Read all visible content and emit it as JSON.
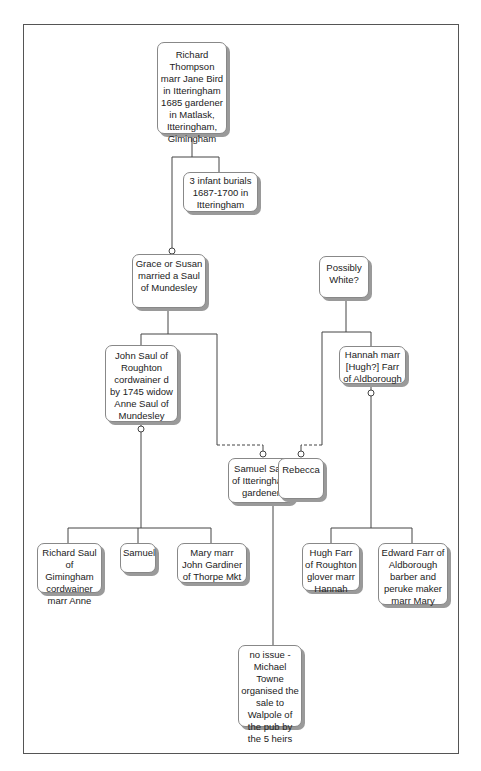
{
  "diagram": {
    "type": "family-tree",
    "nodes": {
      "richard_thompson": "Richard Thompson marr Jane Bird in Itteringham 1685 gardener in Matlask, Itteringham, Gimingham",
      "infant_burials": "3 infant burials 1687-1700 in Itteringham",
      "grace_or_susan": "Grace or Susan married a Saul of Mundesley",
      "possibly_white": "Possibly White?",
      "john_saul": "John Saul of Roughton cordwainer d by 1745 widow Anne Saul of Mundesley",
      "hannah": "Hannah marr [Hugh?] Farr of Aldborough",
      "samuel_saul": "Samuel Saul of Itteringham gardener",
      "rebecca": "Rebecca",
      "richard_saul": "Richard Saul of Gimingham cordwainer marr Anne",
      "samuel": "Samuel",
      "mary": "Mary marr John Gardiner of Thorpe Mkt",
      "hugh_farr": "Hugh Farr of Roughton glover marr Hannah",
      "edward_farr": "Edward Farr of Aldborough barber and peruke maker marr Mary",
      "no_issue": "no issue - Michael Towne organised the sale to Walpole of the pub by the 5 heirs"
    },
    "colors": {
      "line": "#444444",
      "box_border": "#888888",
      "box_shadow": "#9a9a9a",
      "frame": "#555555"
    }
  }
}
